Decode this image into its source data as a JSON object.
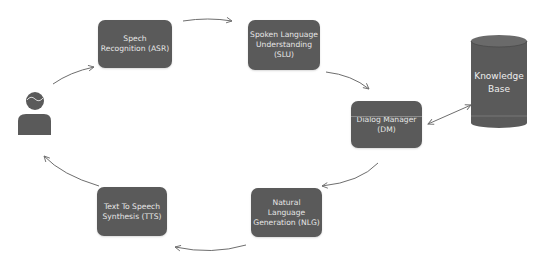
{
  "diagram": {
    "type": "pipeline-cycle",
    "colors": {
      "node_fill": "#5a5a5a",
      "node_text": "#e6e6e6",
      "arrow": "#6e6e6e",
      "background": "#ffffff"
    },
    "user": {
      "icon": "person-icon"
    },
    "nodes": [
      {
        "id": "asr",
        "label": "Spech\nRecognition (ASR)"
      },
      {
        "id": "slu",
        "label": "Spoken Language\nUnderstanding\n(SLU)"
      },
      {
        "id": "dm",
        "label": "Dialog Manager\n(DM)"
      },
      {
        "id": "nlg",
        "label": "Natural Language\nGeneration (NLG)"
      },
      {
        "id": "tts",
        "label": "Text To Speech\nSynthesis (TTS)"
      }
    ],
    "knowledge_base": {
      "label": "Knowledge\nBase",
      "shape": "cylinder"
    },
    "edges": [
      {
        "from": "user",
        "to": "asr"
      },
      {
        "from": "asr",
        "to": "slu"
      },
      {
        "from": "slu",
        "to": "dm"
      },
      {
        "from": "dm",
        "to": "knowledge_base",
        "bidirectional": true
      },
      {
        "from": "dm",
        "to": "nlg"
      },
      {
        "from": "nlg",
        "to": "tts"
      },
      {
        "from": "tts",
        "to": "user"
      }
    ]
  }
}
